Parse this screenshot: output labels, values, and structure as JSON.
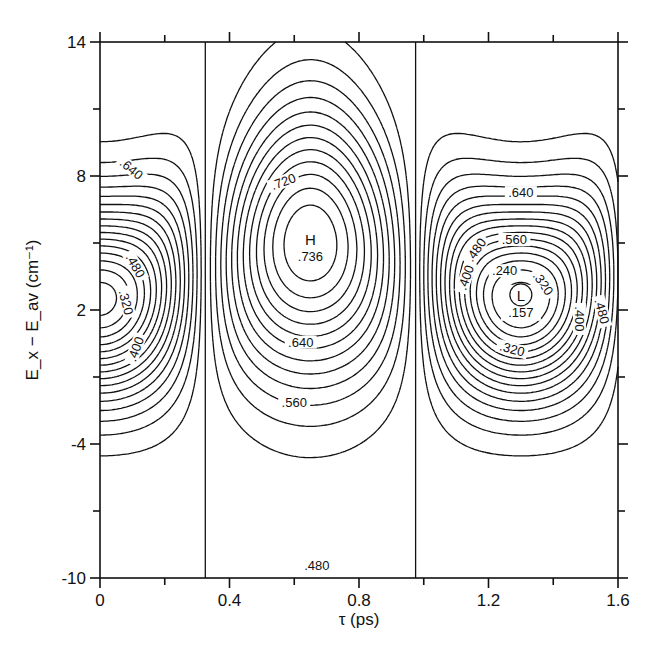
{
  "chart_data": {
    "type": "contour",
    "title": "",
    "xlabel": "τ (ps)",
    "ylabel": "E_x − E_av (cm⁻¹)",
    "xlim": [
      0,
      1.6
    ],
    "ylim": [
      -10,
      14
    ],
    "x_ticks": [
      0,
      0.4,
      0.8,
      1.2,
      1.6
    ],
    "x_tick_labels": [
      "0",
      "0.4",
      "0.8",
      "1.2",
      "1.6"
    ],
    "x_minor_ticks": [
      0.2,
      0.6,
      1.0,
      1.4
    ],
    "y_ticks": [
      -10,
      -4,
      2,
      8,
      14
    ],
    "y_tick_labels": [
      "-10",
      "-4",
      "2",
      "8",
      "14"
    ],
    "y_minor_ticks": [
      -7,
      -1,
      5,
      11
    ],
    "grid": false,
    "contour_interval": 0.04,
    "contour_levels_labeled": [
      0.24,
      0.32,
      0.4,
      0.48,
      0.56,
      0.64,
      0.72
    ],
    "extrema": [
      {
        "type": "max",
        "marker": "H",
        "value": 0.736,
        "x": 0.65,
        "y": 5.0
      },
      {
        "type": "min",
        "marker": "L",
        "value": 0.157,
        "x": 1.3,
        "y": 2.5
      },
      {
        "type": "min",
        "marker": "",
        "value": null,
        "x": 0.0,
        "y": 2.5
      }
    ],
    "contour_labels": [
      {
        "text": ".640",
        "x": 0.09,
        "y": 8.2,
        "angle": 40
      },
      {
        "text": ".480",
        "x": 0.1,
        "y": 3.9,
        "angle": 60
      },
      {
        "text": ".320",
        "x": 0.07,
        "y": 2.3,
        "angle": 75
      },
      {
        "text": ".400",
        "x": 0.12,
        "y": 0.2,
        "angle": -70
      },
      {
        "text": ".720",
        "x": 0.57,
        "y": 7.6,
        "angle": -20
      },
      {
        "text": ".640",
        "x": 0.62,
        "y": 0.4,
        "angle": 0
      },
      {
        "text": ".560",
        "x": 0.6,
        "y": -2.3,
        "angle": 0
      },
      {
        "text": ".480",
        "x": 0.67,
        "y": -9.6,
        "angle": 0
      },
      {
        "text": ".640",
        "x": 1.3,
        "y": 7.1,
        "angle": 0
      },
      {
        "text": ".560",
        "x": 1.28,
        "y": 5.0,
        "angle": 0
      },
      {
        "text": ".480",
        "x": 1.17,
        "y": 4.6,
        "angle": -55
      },
      {
        "text": ".400",
        "x": 1.14,
        "y": 3.4,
        "angle": -70
      },
      {
        "text": ".240",
        "x": 1.25,
        "y": 3.6,
        "angle": 0
      },
      {
        "text": ".320",
        "x": 1.36,
        "y": 3.1,
        "angle": 55
      },
      {
        "text": ".400",
        "x": 1.47,
        "y": 1.6,
        "angle": 90
      },
      {
        "text": ".480",
        "x": 1.54,
        "y": 1.9,
        "angle": 75
      },
      {
        "text": ".320",
        "x": 1.27,
        "y": 0.1,
        "angle": 15
      }
    ]
  }
}
